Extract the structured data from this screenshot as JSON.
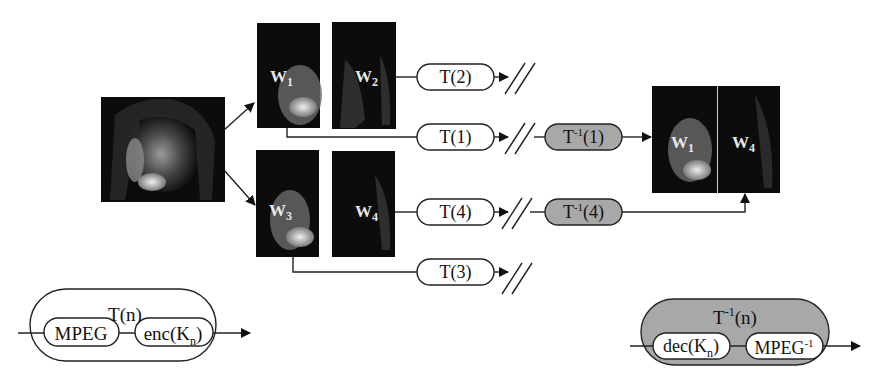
{
  "diagram": {
    "source_image": {
      "description": "woman-on-telephone photo"
    },
    "tiles_top": [
      {
        "id": "w1",
        "label": "W",
        "sub": "1"
      },
      {
        "id": "w2",
        "label": "W",
        "sub": "2"
      }
    ],
    "tiles_bottom": [
      {
        "id": "w3",
        "label": "W",
        "sub": "3"
      },
      {
        "id": "w4",
        "label": "W",
        "sub": "4"
      }
    ],
    "transforms": [
      {
        "id": "t2",
        "label": "T(2)"
      },
      {
        "id": "t1",
        "label": "T(1)"
      },
      {
        "id": "t4",
        "label": "T(4)"
      },
      {
        "id": "t3",
        "label": "T(3)"
      }
    ],
    "inverse_transforms": [
      {
        "id": "ti1",
        "base": "T",
        "sup": "-1",
        "arg": "(1)"
      },
      {
        "id": "ti4",
        "base": "T",
        "sup": "-1",
        "arg": "(4)"
      }
    ],
    "output_image": {
      "tiles": [
        {
          "label": "W",
          "sub": "1"
        },
        {
          "label": "W",
          "sub": "4"
        }
      ]
    },
    "legend_encode": {
      "title": "T(n)",
      "blocks": [
        "MPEG",
        "enc(K",
        "n",
        ")"
      ]
    },
    "legend_decode": {
      "title_base": "T",
      "title_sup": "-1",
      "title_arg": "(n)",
      "block1": "dec(K",
      "block1_sub": "n",
      "block1_close": ")",
      "block2": "MPEG",
      "block2_sup": "-1"
    },
    "colors": {
      "line": "#1a1a1a",
      "inverse_fill": "#a8a8a8",
      "photo_dark": "#0c0c0c"
    }
  }
}
